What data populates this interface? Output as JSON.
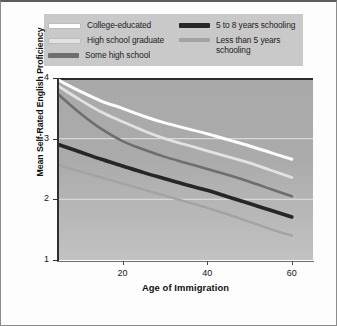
{
  "chart_data": {
    "type": "line",
    "title": "",
    "xlabel": "Age of Immigration",
    "ylabel": "Mean Self-Rated English Proficiency",
    "xlim": [
      5,
      65
    ],
    "ylim": [
      1,
      4
    ],
    "xticks": [
      20,
      40,
      60
    ],
    "yticks": [
      1,
      2,
      3,
      4
    ],
    "grid": "horizontal",
    "legend_position": "top",
    "background": "#ababab",
    "x": [
      5,
      10,
      15,
      20,
      25,
      30,
      35,
      40,
      45,
      50,
      55,
      60
    ],
    "series": [
      {
        "name": "College-educated",
        "color": "#fdfdfd",
        "width": 3.0,
        "values": [
          3.96,
          3.78,
          3.62,
          3.5,
          3.37,
          3.26,
          3.17,
          3.08,
          2.98,
          2.88,
          2.77,
          2.66
        ]
      },
      {
        "name": "High school graduate",
        "color": "#e2e2e2",
        "width": 2.8,
        "values": [
          3.86,
          3.64,
          3.44,
          3.28,
          3.13,
          3.0,
          2.9,
          2.8,
          2.7,
          2.6,
          2.48,
          2.36
        ]
      },
      {
        "name": "Some high school",
        "color": "#6e6e6e",
        "width": 2.6,
        "values": [
          3.72,
          3.42,
          3.16,
          2.96,
          2.82,
          2.7,
          2.6,
          2.5,
          2.4,
          2.29,
          2.17,
          2.05
        ]
      },
      {
        "name": "5 to 8 years schooling",
        "color": "#262626",
        "width": 3.6,
        "values": [
          2.9,
          2.78,
          2.66,
          2.55,
          2.44,
          2.34,
          2.24,
          2.15,
          2.04,
          1.93,
          1.82,
          1.71
        ]
      },
      {
        "name": "Less than 5 years schooling",
        "color": "#a3a3a3",
        "width": 2.4,
        "values": [
          2.56,
          2.46,
          2.36,
          2.26,
          2.16,
          2.06,
          1.96,
          1.86,
          1.75,
          1.63,
          1.51,
          1.4
        ]
      }
    ]
  },
  "legend": {
    "background": "#c9c9c9",
    "entries": [
      {
        "label": "College-educated",
        "color": "#fdfdfd",
        "column": "left",
        "lines": 1
      },
      {
        "label": "High school graduate",
        "color": "#e2e2e2",
        "column": "left",
        "lines": 1
      },
      {
        "label": "Some high school",
        "color": "#6e6e6e",
        "column": "left",
        "lines": 1
      },
      {
        "label": "5 to 8 years schooling",
        "color": "#262626",
        "column": "right",
        "lines": 1
      },
      {
        "label": "Less than 5 years\nschooling",
        "color": "#a3a3a3",
        "column": "right",
        "lines": 2
      }
    ]
  },
  "axes": {
    "y_title": "Mean Self-Rated English Proficiency",
    "x_title": "Age of Immigration",
    "y_tick_labels": [
      "4",
      "3",
      "2",
      "1"
    ],
    "x_tick_labels": [
      "20",
      "40",
      "60"
    ]
  }
}
